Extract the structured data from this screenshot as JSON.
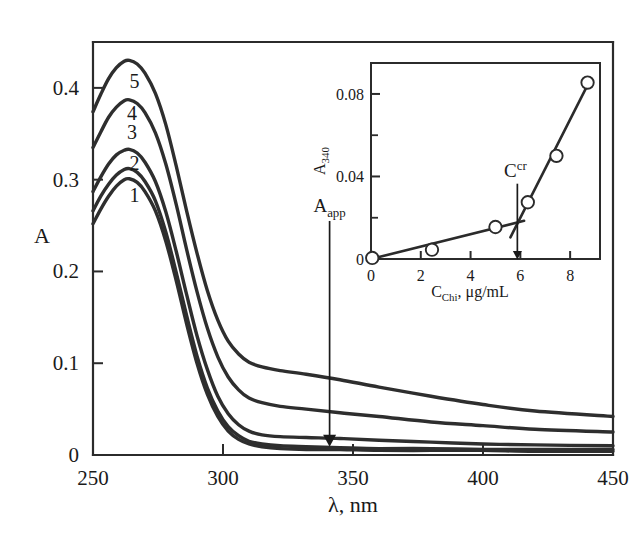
{
  "figure": {
    "background": "#ffffff",
    "ink_color": "#2b2b2b"
  },
  "chart_data": [
    {
      "id": "main-spectra",
      "type": "line",
      "title": "",
      "xlabel": "λ, nm",
      "ylabel": "A",
      "xlim": [
        250,
        450
      ],
      "ylim": [
        0,
        0.45
      ],
      "xticks": [
        250,
        300,
        350,
        400,
        450
      ],
      "xtick_labels": [
        "250",
        "300",
        "350",
        "400",
        "450"
      ],
      "yticks": [
        0,
        0.1,
        0.2,
        0.3,
        0.4
      ],
      "ytick_labels": [
        "0",
        "0.1",
        "0.2",
        "0.3",
        "0.4"
      ],
      "grid": false,
      "legend_position": "inline-curve-labels",
      "series": [
        {
          "name": "1",
          "label": "1",
          "label_x": 266,
          "label_y": 0.283,
          "peak_x": 263,
          "peak_y": 0.301,
          "start_y": 0.252,
          "plateau_y": 0.006,
          "end_y": 0.004,
          "points": [
            [
              250,
              0.252
            ],
            [
              253,
              0.268
            ],
            [
              256,
              0.282
            ],
            [
              259,
              0.293
            ],
            [
              262,
              0.3
            ],
            [
              264,
              0.301
            ],
            [
              267,
              0.297
            ],
            [
              270,
              0.287
            ],
            [
              274,
              0.266
            ],
            [
              278,
              0.233
            ],
            [
              282,
              0.19
            ],
            [
              286,
              0.143
            ],
            [
              290,
              0.1
            ],
            [
              294,
              0.066
            ],
            [
              298,
              0.042
            ],
            [
              302,
              0.026
            ],
            [
              306,
              0.017
            ],
            [
              310,
              0.012
            ],
            [
              315,
              0.009
            ],
            [
              322,
              0.007
            ],
            [
              332,
              0.006
            ],
            [
              345,
              0.006
            ],
            [
              360,
              0.005
            ],
            [
              380,
              0.005
            ],
            [
              400,
              0.005
            ],
            [
              420,
              0.004
            ],
            [
              450,
              0.004
            ]
          ]
        },
        {
          "name": "2",
          "label": "2",
          "label_x": 266,
          "label_y": 0.318,
          "peak_x": 263,
          "peak_y": 0.312,
          "start_y": 0.266,
          "plateau_y": 0.008,
          "end_y": 0.006,
          "points": [
            [
              250,
              0.266
            ],
            [
              253,
              0.282
            ],
            [
              256,
              0.295
            ],
            [
              259,
              0.305
            ],
            [
              262,
              0.311
            ],
            [
              264,
              0.312
            ],
            [
              267,
              0.308
            ],
            [
              270,
              0.298
            ],
            [
              274,
              0.277
            ],
            [
              278,
              0.243
            ],
            [
              282,
              0.199
            ],
            [
              286,
              0.152
            ],
            [
              290,
              0.108
            ],
            [
              294,
              0.073
            ],
            [
              298,
              0.048
            ],
            [
              302,
              0.031
            ],
            [
              306,
              0.021
            ],
            [
              310,
              0.015
            ],
            [
              315,
              0.012
            ],
            [
              322,
              0.01
            ],
            [
              332,
              0.009
            ],
            [
              345,
              0.008
            ],
            [
              360,
              0.007
            ],
            [
              380,
              0.007
            ],
            [
              400,
              0.006
            ],
            [
              420,
              0.006
            ],
            [
              450,
              0.006
            ]
          ]
        },
        {
          "name": "3",
          "label": "3",
          "label_x": 265,
          "label_y": 0.352,
          "peak_x": 263,
          "peak_y": 0.333,
          "start_y": 0.287,
          "plateau_y": 0.019,
          "end_y": 0.01,
          "points": [
            [
              250,
              0.287
            ],
            [
              253,
              0.303
            ],
            [
              256,
              0.317
            ],
            [
              259,
              0.327
            ],
            [
              262,
              0.332
            ],
            [
              264,
              0.333
            ],
            [
              267,
              0.329
            ],
            [
              270,
              0.319
            ],
            [
              274,
              0.298
            ],
            [
              278,
              0.265
            ],
            [
              282,
              0.222
            ],
            [
              286,
              0.175
            ],
            [
              290,
              0.13
            ],
            [
              294,
              0.093
            ],
            [
              298,
              0.064
            ],
            [
              302,
              0.045
            ],
            [
              306,
              0.033
            ],
            [
              310,
              0.026
            ],
            [
              315,
              0.022
            ],
            [
              322,
              0.02
            ],
            [
              332,
              0.019
            ],
            [
              345,
              0.018
            ],
            [
              360,
              0.016
            ],
            [
              380,
              0.014
            ],
            [
              400,
              0.012
            ],
            [
              420,
              0.011
            ],
            [
              450,
              0.01
            ]
          ]
        },
        {
          "name": "4",
          "label": "4",
          "label_x": 265,
          "label_y": 0.373,
          "peak_x": 263,
          "peak_y": 0.387,
          "start_y": 0.335,
          "plateau_y": 0.052,
          "end_y": 0.025,
          "points": [
            [
              250,
              0.335
            ],
            [
              253,
              0.352
            ],
            [
              256,
              0.368
            ],
            [
              259,
              0.379
            ],
            [
              262,
              0.386
            ],
            [
              264,
              0.387
            ],
            [
              267,
              0.383
            ],
            [
              270,
              0.373
            ],
            [
              274,
              0.351
            ],
            [
              278,
              0.317
            ],
            [
              282,
              0.273
            ],
            [
              286,
              0.224
            ],
            [
              290,
              0.178
            ],
            [
              294,
              0.138
            ],
            [
              298,
              0.107
            ],
            [
              302,
              0.085
            ],
            [
              306,
              0.071
            ],
            [
              310,
              0.062
            ],
            [
              315,
              0.057
            ],
            [
              322,
              0.053
            ],
            [
              332,
              0.05
            ],
            [
              345,
              0.046
            ],
            [
              360,
              0.042
            ],
            [
              380,
              0.036
            ],
            [
              400,
              0.032
            ],
            [
              420,
              0.028
            ],
            [
              450,
              0.025
            ]
          ]
        },
        {
          "name": "5",
          "label": "5",
          "label_x": 266,
          "label_y": 0.408,
          "peak_x": 263,
          "peak_y": 0.43,
          "start_y": 0.374,
          "plateau_y": 0.095,
          "end_y": 0.042,
          "points": [
            [
              250,
              0.374
            ],
            [
              253,
              0.393
            ],
            [
              256,
              0.41
            ],
            [
              259,
              0.422
            ],
            [
              262,
              0.429
            ],
            [
              264,
              0.43
            ],
            [
              267,
              0.426
            ],
            [
              270,
              0.416
            ],
            [
              274,
              0.394
            ],
            [
              278,
              0.36
            ],
            [
              282,
              0.315
            ],
            [
              286,
              0.266
            ],
            [
              290,
              0.22
            ],
            [
              294,
              0.179
            ],
            [
              298,
              0.147
            ],
            [
              302,
              0.124
            ],
            [
              306,
              0.11
            ],
            [
              310,
              0.101
            ],
            [
              315,
              0.096
            ],
            [
              322,
              0.092
            ],
            [
              332,
              0.088
            ],
            [
              345,
              0.082
            ],
            [
              360,
              0.074
            ],
            [
              380,
              0.064
            ],
            [
              400,
              0.055
            ],
            [
              420,
              0.048
            ],
            [
              450,
              0.042
            ]
          ]
        }
      ],
      "annotations": [
        {
          "name": "a-app-arrow",
          "label": "A",
          "label_sub": "app",
          "x": 341,
          "y_from": 0.255,
          "y_to": 0.01
        }
      ]
    },
    {
      "id": "inset-calibration",
      "type": "scatter",
      "title": "",
      "xlabel": "C",
      "xlabel_sub": "Chi",
      "xlabel_rest": ", μg/mL",
      "xlabel_full": "C_Chi, μg/mL",
      "ylabel": "A",
      "ylabel_sub": "340",
      "ylabel_full": "A_340",
      "xlim": [
        0,
        9.2
      ],
      "ylim": [
        0,
        0.095
      ],
      "xticks": [
        0,
        2,
        4,
        6,
        8
      ],
      "xtick_labels": [
        "0",
        "2",
        "4",
        "6",
        "8"
      ],
      "yticks": [
        0,
        0.04,
        0.08
      ],
      "ytick_labels": [
        "0",
        "0.04",
        "0.08"
      ],
      "yticks_minor": [
        0.02,
        0.06
      ],
      "grid": false,
      "points": [
        {
          "x": 0.05,
          "y": 0.0005
        },
        {
          "x": 2.45,
          "y": 0.0045
        },
        {
          "x": 5.0,
          "y": 0.0155
        },
        {
          "x": 6.3,
          "y": 0.0275
        },
        {
          "x": 7.45,
          "y": 0.05
        },
        {
          "x": 8.7,
          "y": 0.0855
        }
      ],
      "fit_lines": [
        {
          "name": "low-slope-segment",
          "x1": 0.0,
          "y1": 0.0,
          "x2": 6.15,
          "y2": 0.0185
        },
        {
          "name": "high-slope-segment",
          "x1": 5.6,
          "y1": 0.0105,
          "x2": 8.75,
          "y2": 0.0855
        }
      ],
      "annotations": [
        {
          "name": "c-critical-marker",
          "label": "C",
          "label_sup": "cr",
          "x": 5.88,
          "y_from": 0.0365,
          "y_to": 0.0
        }
      ]
    }
  ]
}
